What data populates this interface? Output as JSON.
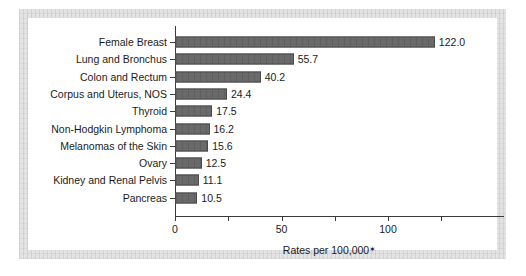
{
  "chart_data": {
    "type": "bar",
    "orientation": "horizontal",
    "title": "",
    "subtitle": "",
    "xlabel": "Rates per 100,000",
    "xlabel_footnote_marker": "✶",
    "ylabel": "",
    "categories": [
      "Female Breast",
      "Lung and Bronchus",
      "Colon and Rectum",
      "Corpus and Uterus, NOS",
      "Thyroid",
      "Non-Hodgkin Lymphoma",
      "Melanomas of the Skin",
      "Ovary",
      "Kidney and Renal Pelvis",
      "Pancreas"
    ],
    "values": [
      122.0,
      55.7,
      40.2,
      24.4,
      17.5,
      16.2,
      15.6,
      12.5,
      11.1,
      10.5
    ],
    "value_labels": [
      "122.0",
      "55.7",
      "40.2",
      "24.4",
      "17.5",
      "16.2",
      "15.6",
      "12.5",
      "11.1",
      "10.5"
    ],
    "xlim": [
      0,
      132
    ],
    "xticks": [
      0,
      25,
      50,
      75,
      100,
      125
    ],
    "xtick_labels": [
      "0",
      "",
      "50",
      "",
      "100",
      ""
    ],
    "grid": false,
    "legend": null,
    "bar_color": "#6a6a6a",
    "bar_edge_color": "#4a4a4a",
    "axis_color": "#3a3a3a",
    "text_color": "#1b1b1b",
    "frame_color": "#e3e3e3",
    "plot_background": "#ffffff"
  }
}
